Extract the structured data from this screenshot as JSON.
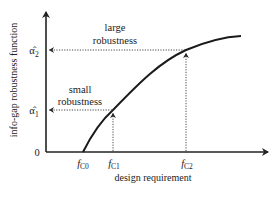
{
  "diagram": {
    "y_axis_label": "info-gap robustness function",
    "x_axis_label": "design requirement",
    "origin_label": "0",
    "y_ticks": [
      {
        "symbol": "α̂",
        "subscript": "2"
      },
      {
        "symbol": "α̂",
        "subscript": "1"
      }
    ],
    "x_ticks": [
      {
        "symbol": "f",
        "subscript": "C0"
      },
      {
        "symbol": "f",
        "subscript": "C1"
      },
      {
        "symbol": "f",
        "subscript": "C2"
      }
    ],
    "annotations": {
      "large": {
        "line1": "large",
        "line2": "robustness"
      },
      "small": {
        "line1": "small",
        "line2": "robustness"
      }
    },
    "colors": {
      "axis": "#222222",
      "curve": "#1a1a1a",
      "dotted": "#333333",
      "background": "#ffffff"
    }
  }
}
